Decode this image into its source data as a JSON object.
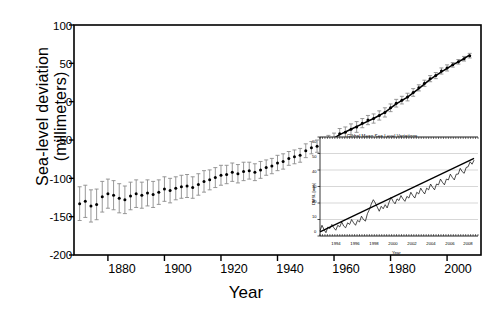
{
  "figure": {
    "background": "#ffffff",
    "line_color": "#000000",
    "errorbar_color": "#8c8c8c"
  },
  "chart_data": {
    "type": "scatter",
    "title": "",
    "xlabel": "Year",
    "ylabel": "Sea-level deviation (millimeters)",
    "xlim": [
      1868,
      2012
    ],
    "ylim": [
      -200,
      100
    ],
    "ytick_labels": [
      "100",
      "50",
      "0",
      "-50",
      "-100",
      "-150",
      "-200"
    ],
    "ytick_values": [
      100,
      50,
      0,
      -50,
      -100,
      -150,
      -200
    ],
    "xtick_labels": [
      "1880",
      "1900",
      "1920",
      "1940",
      "1960",
      "1980",
      "2000"
    ],
    "xtick_values": [
      1880,
      1900,
      1920,
      1940,
      1960,
      1980,
      2000
    ],
    "grid": false,
    "legend": "none",
    "series": [
      {
        "name": "Sea-level deviation",
        "marker": "filled-circle",
        "errorbars": "vertical",
        "x": [
          1870,
          1872,
          1874,
          1876,
          1878,
          1880,
          1882,
          1884,
          1886,
          1888,
          1890,
          1892,
          1894,
          1896,
          1898,
          1900,
          1902,
          1904,
          1906,
          1908,
          1910,
          1912,
          1914,
          1916,
          1918,
          1920,
          1922,
          1924,
          1926,
          1928,
          1930,
          1932,
          1934,
          1936,
          1938,
          1940,
          1942,
          1944,
          1946,
          1948,
          1950,
          1952,
          1954,
          1956,
          1958,
          1960,
          1962,
          1964,
          1966,
          1968,
          1970,
          1972,
          1974,
          1976,
          1978,
          1980,
          1982,
          1984,
          1986,
          1988,
          1990,
          1992,
          1994,
          1996,
          1998,
          2000,
          2002,
          2004,
          2006,
          2008
        ],
        "y": [
          -133,
          -130,
          -136,
          -134,
          -124,
          -120,
          -122,
          -126,
          -128,
          -123,
          -120,
          -122,
          -119,
          -121,
          -118,
          -114,
          -116,
          -113,
          -111,
          -110,
          -112,
          -108,
          -104,
          -102,
          -99,
          -96,
          -95,
          -92,
          -94,
          -91,
          -90,
          -92,
          -89,
          -86,
          -84,
          -80,
          -78,
          -74,
          -72,
          -70,
          -64,
          -60,
          -58,
          -55,
          -52,
          -48,
          -42,
          -40,
          -36,
          -33,
          -28,
          -24,
          -22,
          -18,
          -14,
          -8,
          -2,
          2,
          6,
          12,
          18,
          24,
          30,
          34,
          40,
          44,
          48,
          52,
          56,
          60
        ],
        "yerr": [
          22,
          21,
          21,
          20,
          20,
          19,
          19,
          19,
          18,
          18,
          18,
          17,
          17,
          17,
          16,
          16,
          16,
          15,
          15,
          15,
          14,
          14,
          14,
          13,
          13,
          13,
          12,
          12,
          12,
          12,
          11,
          11,
          11,
          10,
          10,
          10,
          10,
          9,
          9,
          9,
          9,
          8,
          8,
          8,
          8,
          7,
          7,
          7,
          7,
          7,
          6,
          6,
          6,
          6,
          6,
          5,
          5,
          5,
          5,
          5,
          4,
          4,
          4,
          4,
          4,
          4,
          3,
          3,
          3,
          3
        ]
      },
      {
        "name": "Smoothed trend",
        "marker": "none",
        "style": "solid-line",
        "x": [
          1958,
          1962,
          1966,
          1970,
          1974,
          1978,
          1982,
          1986,
          1990,
          1994,
          1998,
          2002,
          2006,
          2008
        ],
        "y": [
          -52,
          -43,
          -36,
          -29,
          -22,
          -14,
          -3,
          6,
          17,
          29,
          39,
          48,
          56,
          61
        ]
      }
    ],
    "inset": {
      "type": "line",
      "title": "Global Mean Sea Level Variations",
      "annotation": "Rate = 3.5 mm/year",
      "xlabel": "Year",
      "ylabel": "DMSL [mm]",
      "xlim": [
        1993,
        2009
      ],
      "ylim": [
        0,
        60
      ],
      "ytick_labels": [
        "0",
        "10",
        "20",
        "30",
        "40",
        "50",
        "60"
      ],
      "ytick_values": [
        0,
        10,
        20,
        30,
        40,
        50,
        60
      ],
      "xtick_labels": [
        "1994",
        "1996",
        "1998",
        "2000",
        "2002",
        "2004",
        "2006",
        "2008"
      ],
      "xtick_values": [
        1994,
        1996,
        1998,
        2000,
        2002,
        2004,
        2006,
        2008
      ],
      "grid": true,
      "series": [
        {
          "name": "Satellite altimetry DMSL",
          "style": "noisy-line",
          "x": [
            1993.0,
            1993.2,
            1993.4,
            1993.6,
            1993.8,
            1994.0,
            1994.2,
            1994.4,
            1994.6,
            1994.8,
            1995.0,
            1995.2,
            1995.4,
            1995.6,
            1995.8,
            1996.0,
            1996.2,
            1996.4,
            1996.6,
            1996.8,
            1997.0,
            1997.2,
            1997.4,
            1997.6,
            1997.8,
            1998.0,
            1998.2,
            1998.4,
            1998.6,
            1998.8,
            1999.0,
            1999.2,
            1999.4,
            1999.6,
            1999.8,
            2000.0,
            2000.2,
            2000.4,
            2000.6,
            2000.8,
            2001.0,
            2001.2,
            2001.4,
            2001.6,
            2001.8,
            2002.0,
            2002.2,
            2002.4,
            2002.6,
            2002.8,
            2003.0,
            2003.2,
            2003.4,
            2003.6,
            2003.8,
            2004.0,
            2004.2,
            2004.4,
            2004.6,
            2004.8,
            2005.0,
            2005.2,
            2005.4,
            2005.6,
            2005.8,
            2006.0,
            2006.2,
            2006.4,
            2006.6,
            2006.8,
            2007.0,
            2007.2,
            2007.4,
            2007.6,
            2007.8,
            2008.0,
            2008.2,
            2008.4,
            2008.6
          ],
          "y": [
            3.0,
            6.5,
            4.0,
            2.0,
            5.5,
            4.5,
            7.0,
            5.0,
            3.5,
            6.5,
            5.5,
            8.5,
            6.0,
            5.0,
            8.0,
            7.0,
            10.0,
            8.0,
            6.5,
            9.5,
            8.5,
            12.0,
            10.0,
            9.0,
            13.5,
            16.0,
            19.5,
            22.0,
            20.0,
            17.5,
            15.0,
            18.0,
            16.5,
            19.0,
            17.0,
            20.5,
            23.5,
            21.0,
            19.5,
            22.5,
            21.5,
            24.5,
            22.5,
            21.0,
            24.0,
            23.0,
            26.5,
            24.5,
            23.0,
            26.5,
            25.5,
            29.0,
            27.0,
            25.5,
            29.0,
            28.0,
            31.5,
            29.5,
            28.0,
            31.5,
            31.0,
            34.5,
            32.5,
            31.0,
            34.5,
            34.0,
            37.5,
            35.5,
            34.0,
            37.5,
            37.5,
            41.0,
            39.0,
            38.0,
            41.5,
            42.0,
            45.0,
            43.5,
            46.0
          ]
        },
        {
          "name": "Linear trend",
          "style": "solid-line",
          "x": [
            1993.0,
            2008.6
          ],
          "y": [
            2.5,
            47.0
          ]
        }
      ]
    }
  }
}
